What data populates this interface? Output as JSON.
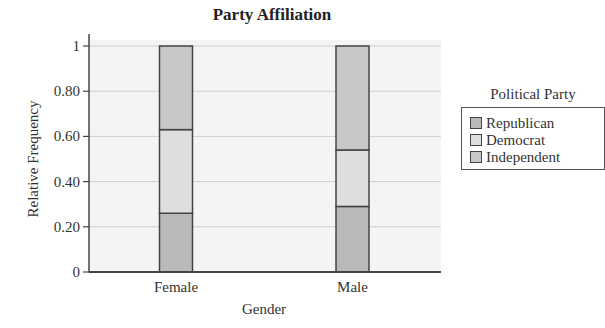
{
  "chart_data": {
    "type": "bar",
    "stacked": true,
    "title": "Party Affiliation",
    "xlabel": "Gender",
    "ylabel": "Relative Frequency",
    "categories": [
      "Female",
      "Male"
    ],
    "series": [
      {
        "name": "Republican",
        "values": [
          0.26,
          0.29
        ],
        "color": "#b9b9b9"
      },
      {
        "name": "Democrat",
        "values": [
          0.37,
          0.25
        ],
        "color": "#dedede"
      },
      {
        "name": "Independent",
        "values": [
          0.37,
          0.46
        ],
        "color": "#c8c8c8"
      }
    ],
    "ylim": [
      0,
      1
    ],
    "yticks": [
      0,
      0.2,
      0.4,
      0.6,
      0.8,
      1
    ],
    "ytick_labels": [
      "0",
      "0.20",
      "0.40",
      "0.60",
      "0.80",
      "1"
    ],
    "grid": true,
    "legend": {
      "title": "Political Party",
      "position": "right",
      "entries": [
        "Republican",
        "Democrat",
        "Independent"
      ]
    }
  },
  "colors": {
    "plot_bg": "#f4f4f4",
    "grid": "#cfcfcf",
    "axis": "#444444",
    "bar_border": "#444444"
  }
}
